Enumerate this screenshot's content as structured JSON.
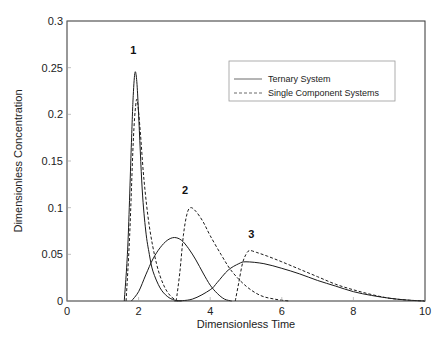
{
  "chart_data": {
    "type": "line",
    "title": "",
    "xlabel": "Dimensionless Time",
    "ylabel": "Dimensionless Concentration",
    "xlim": [
      0,
      10
    ],
    "ylim": [
      0,
      0.3
    ],
    "xticks": [
      0,
      2,
      4,
      6,
      8,
      10
    ],
    "xtick_labels": [
      "0",
      "2",
      "4",
      "6",
      "8",
      "10"
    ],
    "yticks": [
      0,
      0.05,
      0.1,
      0.15,
      0.2,
      0.25,
      0.3
    ],
    "ytick_labels": [
      "0",
      "0.05",
      "0.1",
      "0.15",
      "0.2",
      "0.25",
      "0.3"
    ],
    "grid": false,
    "legend_position": "upper right",
    "legend": [
      "Ternary System",
      "Single Component Systems"
    ],
    "annotations": [
      {
        "text": "1",
        "x": 1.85,
        "y": 0.265
      },
      {
        "text": "2",
        "x": 3.3,
        "y": 0.115
      },
      {
        "text": "3",
        "x": 5.15,
        "y": 0.067
      }
    ],
    "series": [
      {
        "name": "Ternary System - Component 1",
        "style": "solid",
        "x": [
          1.6,
          1.7,
          1.8,
          1.85,
          1.9,
          1.95,
          2.0,
          2.1,
          2.2,
          2.3,
          2.4,
          2.6,
          2.8,
          3.0,
          3.2
        ],
        "y": [
          0.0,
          0.06,
          0.17,
          0.22,
          0.245,
          0.235,
          0.2,
          0.12,
          0.075,
          0.05,
          0.032,
          0.014,
          0.005,
          0.001,
          0.0
        ]
      },
      {
        "name": "Ternary System - Component 2",
        "style": "solid",
        "x": [
          1.8,
          2.0,
          2.2,
          2.4,
          2.6,
          2.8,
          3.0,
          3.2,
          3.4,
          3.6,
          3.8,
          4.0,
          4.2,
          4.4,
          4.6
        ],
        "y": [
          0.0,
          0.01,
          0.028,
          0.045,
          0.057,
          0.065,
          0.068,
          0.065,
          0.056,
          0.044,
          0.03,
          0.017,
          0.008,
          0.002,
          0.0
        ]
      },
      {
        "name": "Ternary System - Component 3",
        "style": "solid",
        "x": [
          3.0,
          3.5,
          4.0,
          4.2,
          4.5,
          4.8,
          5.0,
          5.5,
          6.0,
          6.5,
          7.0,
          7.5,
          8.0,
          8.5,
          9.0,
          9.5,
          10.0
        ],
        "y": [
          0.0,
          0.002,
          0.012,
          0.02,
          0.033,
          0.04,
          0.042,
          0.04,
          0.035,
          0.029,
          0.022,
          0.016,
          0.01,
          0.006,
          0.003,
          0.001,
          0.0
        ]
      },
      {
        "name": "Single Component - 1",
        "style": "dashed",
        "x": [
          1.65,
          1.75,
          1.85,
          1.92,
          1.97,
          2.05,
          2.15,
          2.3,
          2.5,
          2.7,
          2.9,
          3.1
        ],
        "y": [
          0.0,
          0.07,
          0.17,
          0.21,
          0.213,
          0.18,
          0.13,
          0.08,
          0.04,
          0.017,
          0.005,
          0.0
        ]
      },
      {
        "name": "Single Component - 2",
        "style": "dashed",
        "x": [
          3.05,
          3.15,
          3.25,
          3.35,
          3.45,
          3.6,
          3.8,
          4.0,
          4.3,
          4.6,
          5.0,
          5.4,
          5.8,
          6.2
        ],
        "y": [
          0.0,
          0.03,
          0.07,
          0.093,
          0.1,
          0.096,
          0.085,
          0.07,
          0.05,
          0.032,
          0.016,
          0.006,
          0.002,
          0.0
        ]
      },
      {
        "name": "Single Component - 3",
        "style": "dashed",
        "x": [
          4.7,
          4.8,
          4.9,
          5.0,
          5.1,
          5.3,
          5.6,
          6.0,
          6.5,
          7.0,
          7.5,
          8.0,
          8.5,
          9.0,
          9.5,
          10.0
        ],
        "y": [
          0.0,
          0.02,
          0.04,
          0.05,
          0.054,
          0.052,
          0.048,
          0.042,
          0.034,
          0.026,
          0.018,
          0.012,
          0.007,
          0.003,
          0.001,
          0.0
        ]
      }
    ]
  },
  "colors": {
    "line": "#1a1a1a",
    "axis": "#333333",
    "legend_border": "#999999",
    "background": "#ffffff"
  }
}
